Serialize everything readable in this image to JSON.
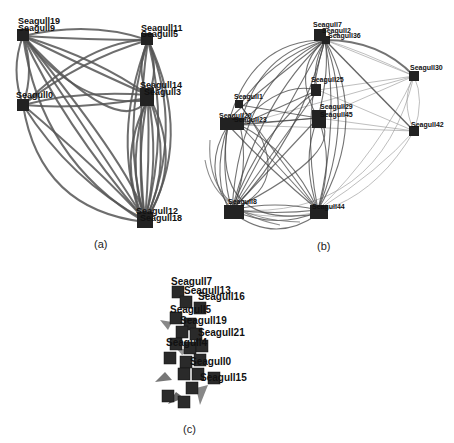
{
  "figure": {
    "panels": [
      {
        "id": "a",
        "caption": "(a)",
        "nodes": [
          {
            "label": "Seagull19",
            "x": 23,
            "y": 33
          },
          {
            "label": "Seagull9",
            "x": 23,
            "y": 36
          },
          {
            "label": "Seagull11",
            "x": 148,
            "y": 38
          },
          {
            "label": "Seagull5",
            "x": 146,
            "y": 42
          },
          {
            "label": "Seagull0",
            "x": 23,
            "y": 105
          },
          {
            "label": "Seagull14",
            "x": 147,
            "y": 92
          },
          {
            "label": "Seagull3",
            "x": 147,
            "y": 100
          },
          {
            "label": "Seagull12",
            "x": 143,
            "y": 218
          },
          {
            "label": "Seagull18",
            "x": 145,
            "y": 224
          }
        ]
      },
      {
        "id": "b",
        "caption": "(b)",
        "nodes": [
          {
            "label": "Seagull7",
            "x": 318,
            "y": 33
          },
          {
            "label": "Seagull2",
            "x": 324,
            "y": 38
          },
          {
            "label": "Seagull36",
            "x": 330,
            "y": 42
          },
          {
            "label": "Seagull30",
            "x": 414,
            "y": 76
          },
          {
            "label": "Seagull42",
            "x": 414,
            "y": 131
          },
          {
            "label": "Seagull25",
            "x": 315,
            "y": 88
          },
          {
            "label": "Seagull29",
            "x": 318,
            "y": 112
          },
          {
            "label": "Seagull45",
            "x": 318,
            "y": 120
          },
          {
            "label": "Seagull1",
            "x": 238,
            "y": 103
          },
          {
            "label": "Seagull20",
            "x": 225,
            "y": 122
          },
          {
            "label": "Seagull23",
            "x": 238,
            "y": 125
          },
          {
            "label": "Seagull8",
            "x": 232,
            "y": 210
          },
          {
            "label": "Seagull44",
            "x": 318,
            "y": 210
          }
        ]
      },
      {
        "id": "c",
        "caption": "(c)",
        "nodes": [
          {
            "label": "Seagull7",
            "x": 178,
            "y": 290
          },
          {
            "label": "Seagull13",
            "x": 190,
            "y": 299
          },
          {
            "label": "Seagull16",
            "x": 206,
            "y": 305
          },
          {
            "label": "Seagull5",
            "x": 180,
            "y": 312
          },
          {
            "label": "Seagull19",
            "x": 184,
            "y": 324
          },
          {
            "label": "Seagull21",
            "x": 200,
            "y": 336
          },
          {
            "label": "Seagull4",
            "x": 178,
            "y": 344
          },
          {
            "label": "Seagull0",
            "x": 196,
            "y": 363
          },
          {
            "label": "Seagull15",
            "x": 206,
            "y": 380
          }
        ]
      }
    ]
  }
}
